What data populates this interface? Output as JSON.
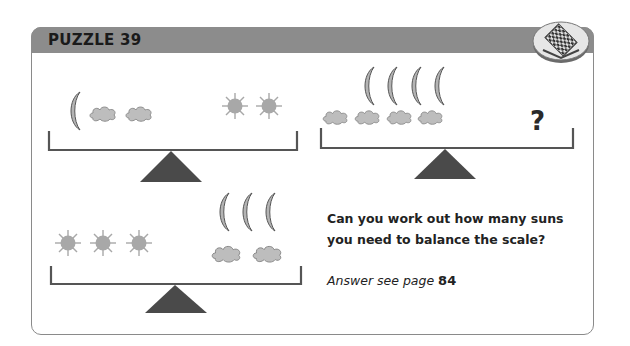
{
  "puzzle": {
    "title": "PUZZLE 39",
    "question": "Can you work out how many suns you need to balance the scale?",
    "answer_prefix": "Answer see page",
    "answer_page": "84",
    "unknown_marker": "?"
  },
  "colors": {
    "header": "#8c8c8c",
    "frame": "#8a8a8a",
    "beam": "#555555",
    "fulcrum": "#4a4a4a",
    "sun": "#a8a8a8",
    "cloud": "#bdbdbd",
    "moon": "#b0b0b0"
  },
  "scales": [
    {
      "left": {
        "moons": 1,
        "clouds": 2
      },
      "right": {
        "suns": 2
      }
    },
    {
      "left": {
        "moons": 4,
        "clouds": 4
      },
      "right": {
        "suns": "?"
      }
    },
    {
      "left": {
        "suns": 3
      },
      "right": {
        "moons": 3,
        "clouds": 2
      }
    }
  ]
}
